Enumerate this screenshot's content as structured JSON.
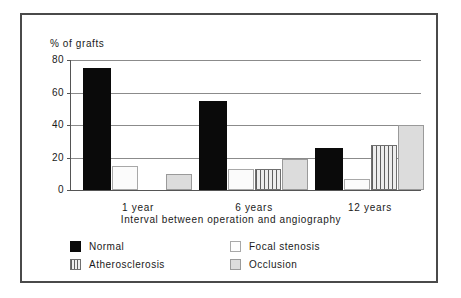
{
  "chart_data": {
    "type": "bar",
    "title": "",
    "xlabel": "Interval between operation and angiography",
    "ylabel": "% of grafts",
    "categories": [
      "1 year",
      "6 years",
      "12 years"
    ],
    "ylim": [
      0,
      80
    ],
    "yticks": [
      0,
      20,
      40,
      60,
      80
    ],
    "ytick_labels": [
      "0",
      "20",
      "40",
      "60",
      "80"
    ],
    "grid": true,
    "legend_position": "bottom",
    "series": [
      {
        "name": "Normal",
        "values": [
          75,
          55,
          26
        ],
        "color": "#0a0a0a",
        "pattern": "solid"
      },
      {
        "name": "Focal stenosis",
        "values": [
          15,
          13,
          7
        ],
        "color": "#fbfbfb",
        "pattern": "empty"
      },
      {
        "name": "Atherosclerosis",
        "values": [
          0,
          13,
          28
        ],
        "color": "#ededed",
        "pattern": "vertical-stripes"
      },
      {
        "name": "Occlusion",
        "values": [
          10,
          19,
          40
        ],
        "color": "#dcdcdc",
        "pattern": "light-fill"
      }
    ]
  },
  "axis": {
    "y_title": "% of grafts",
    "x_title": "Interval between operation and angiography",
    "y_labels": [
      "80",
      "60",
      "40",
      "20",
      "0"
    ],
    "x_labels": [
      "1 year",
      "6 years",
      "12 years"
    ]
  },
  "legend": {
    "entries": [
      {
        "label": "Normal"
      },
      {
        "label": "Focal stenosis"
      },
      {
        "label": "Atherosclerosis"
      },
      {
        "label": "Occlusion"
      }
    ]
  }
}
